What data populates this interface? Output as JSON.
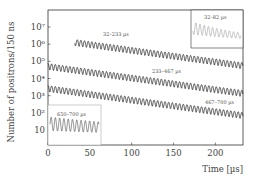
{
  "chart_data": {
    "type": "line",
    "title": "",
    "xlabel": "Time [µs]",
    "ylabel": "Number of positrons/150 ns",
    "xlim": [
      0,
      233
    ],
    "ylog": true,
    "ylim_exp": [
      0.3,
      7.9
    ],
    "x_ticks": [
      0,
      50,
      100,
      150,
      200
    ],
    "x_tick_labels": [
      "0",
      "50",
      "100",
      "150",
      "200"
    ],
    "y_ticks_exp": [
      1,
      2,
      3,
      4,
      5,
      6,
      7
    ],
    "y_tick_labels": [
      "10",
      "10²",
      "10³",
      "10⁴",
      "10⁵",
      "10⁶",
      "10⁷"
    ],
    "grid": false,
    "lifetime_us": 64.4,
    "wiggle_period_us": 4.37,
    "wiggle_amplitude": 0.4,
    "series": [
      {
        "name": "32–233 µs",
        "t_start": 32,
        "t_end": 233,
        "n0_at_start": 1350000
      },
      {
        "name": "233–467 µs",
        "t_start": 0,
        "t_end": 233,
        "n0_at_start": 54000
      },
      {
        "name": "467–700 µs",
        "t_start": 0,
        "t_end": 233,
        "n0_at_start": 2800
      }
    ],
    "insets": [
      {
        "name": "32–82 µs",
        "position": "top-right",
        "t_range": [
          32,
          82
        ]
      },
      {
        "name": "650–700 µs",
        "position": "bottom-left",
        "t_range": [
          650,
          700
        ]
      }
    ],
    "annotations": [
      "32–233 µs",
      "233–467 µs",
      "467–700 µs",
      "32–82 µs",
      "650–700 µs"
    ]
  }
}
